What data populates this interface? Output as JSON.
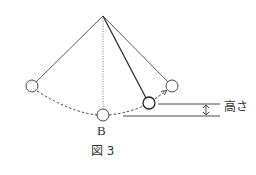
{
  "figure": {
    "caption": "図 3",
    "point_label": "B",
    "height_label": "高さ"
  },
  "colors": {
    "line": "#333333",
    "background": "#ffffff"
  }
}
